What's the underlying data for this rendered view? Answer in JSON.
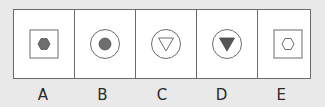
{
  "figure": {
    "stroke_color": "#6b6b6b",
    "fill_color": "#6e6e6e",
    "background_color": "#e9e9e9",
    "cell_background": "#ffffff"
  },
  "options": [
    {
      "label": "A",
      "outer": "square",
      "inner": "hexagon",
      "inner_filled": true
    },
    {
      "label": "B",
      "outer": "circle",
      "inner": "circle",
      "inner_filled": true
    },
    {
      "label": "C",
      "outer": "circle",
      "inner": "triangle-down",
      "inner_filled": false
    },
    {
      "label": "D",
      "outer": "circle",
      "inner": "triangle-down",
      "inner_filled": true
    },
    {
      "label": "E",
      "outer": "square",
      "inner": "hexagon",
      "inner_filled": false
    }
  ]
}
